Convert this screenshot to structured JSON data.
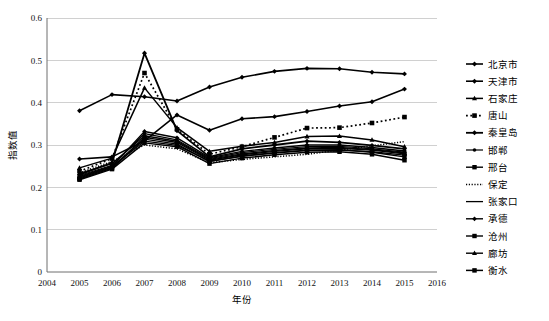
{
  "chart_data": {
    "type": "line",
    "title": "",
    "xlabel": "年份",
    "ylabel": "指数值",
    "xlim": [
      2004,
      2016
    ],
    "ylim": [
      0,
      0.6
    ],
    "grid": true,
    "legend_position": "right",
    "x": [
      2005,
      2006,
      2007,
      2008,
      2009,
      2010,
      2011,
      2012,
      2013,
      2014,
      2015
    ],
    "xticks": [
      "2004",
      "2005",
      "2006",
      "2007",
      "2008",
      "2009",
      "2010",
      "2011",
      "2012",
      "2013",
      "2014",
      "2015",
      "2016"
    ],
    "yticks": [
      "0",
      "0.1",
      "0.2",
      "0.3",
      "0.4",
      "0.5",
      "0.6"
    ],
    "series": [
      {
        "name": "北京市",
        "marker": "diamond",
        "dash": "none",
        "width": 1.6,
        "values": [
          0.381,
          0.419,
          0.414,
          0.404,
          0.437,
          0.46,
          0.474,
          0.481,
          0.48,
          0.472,
          0.468
        ]
      },
      {
        "name": "天津市",
        "marker": "diamond",
        "dash": "none",
        "width": 1.6,
        "values": [
          0.267,
          0.272,
          0.31,
          0.371,
          0.335,
          0.362,
          0.367,
          0.379,
          0.392,
          0.402,
          0.432
        ]
      },
      {
        "name": "石家庄",
        "marker": "triangle",
        "dash": "none",
        "width": 1.5,
        "values": [
          0.246,
          0.269,
          0.435,
          0.341,
          0.285,
          0.297,
          0.306,
          0.32,
          0.321,
          0.312,
          0.296
        ]
      },
      {
        "name": "唐山",
        "marker": "square",
        "dash": "dotted",
        "width": 1.7,
        "values": [
          0.238,
          0.268,
          0.47,
          0.337,
          0.278,
          0.296,
          0.318,
          0.34,
          0.341,
          0.352,
          0.366
        ]
      },
      {
        "name": "秦皇岛",
        "marker": "diamond",
        "dash": "none",
        "width": 1.8,
        "values": [
          0.23,
          0.258,
          0.517,
          0.334,
          0.272,
          0.291,
          0.3,
          0.309,
          0.306,
          0.299,
          0.291
        ]
      },
      {
        "name": "邯郸",
        "marker": "dot",
        "dash": "none",
        "width": 1.2,
        "values": [
          0.228,
          0.252,
          0.327,
          0.312,
          0.268,
          0.282,
          0.29,
          0.296,
          0.297,
          0.291,
          0.283
        ]
      },
      {
        "name": "邢台",
        "marker": "square",
        "dash": "none",
        "width": 1.4,
        "values": [
          0.222,
          0.247,
          0.318,
          0.306,
          0.264,
          0.277,
          0.285,
          0.291,
          0.292,
          0.288,
          0.279
        ]
      },
      {
        "name": "保定",
        "marker": "none",
        "dash": "fine-dotted",
        "width": 1.5,
        "values": [
          0.234,
          0.261,
          0.3,
          0.291,
          0.258,
          0.266,
          0.272,
          0.278,
          0.288,
          0.298,
          0.308
        ]
      },
      {
        "name": "张家口",
        "marker": "none",
        "dash": "none",
        "width": 1.3,
        "values": [
          0.226,
          0.25,
          0.309,
          0.299,
          0.262,
          0.273,
          0.281,
          0.287,
          0.288,
          0.284,
          0.276
        ]
      },
      {
        "name": "承德",
        "marker": "diamond",
        "dash": "none",
        "width": 1.4,
        "values": [
          0.224,
          0.249,
          0.332,
          0.317,
          0.27,
          0.285,
          0.293,
          0.3,
          0.3,
          0.294,
          0.286
        ]
      },
      {
        "name": "沧州",
        "marker": "square",
        "dash": "none",
        "width": 1.4,
        "values": [
          0.22,
          0.245,
          0.314,
          0.302,
          0.261,
          0.274,
          0.282,
          0.288,
          0.289,
          0.283,
          0.272
        ]
      },
      {
        "name": "廊坊",
        "marker": "triangle",
        "dash": "none",
        "width": 1.4,
        "values": [
          0.233,
          0.256,
          0.322,
          0.309,
          0.266,
          0.279,
          0.287,
          0.293,
          0.294,
          0.289,
          0.281
        ]
      },
      {
        "name": "衡水",
        "marker": "square",
        "dash": "none",
        "width": 1.5,
        "values": [
          0.218,
          0.243,
          0.305,
          0.296,
          0.256,
          0.269,
          0.277,
          0.283,
          0.284,
          0.278,
          0.264
        ]
      }
    ]
  },
  "colors": {
    "line": "#000000",
    "grid": "#d0d0d0",
    "axis": "#6f6f6f",
    "background": "#ffffff"
  }
}
